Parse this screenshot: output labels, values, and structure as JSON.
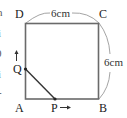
{
  "figure": {
    "vertices": {
      "D": "D",
      "C": "C",
      "A": "A",
      "B": "B"
    },
    "moving_points": {
      "Q": "Q",
      "P": "P"
    },
    "dimensions": {
      "top": "6cm",
      "right": "6cm"
    },
    "arrows": {
      "Q_direction": "up",
      "P_direction": "right"
    },
    "edge_fragments": [
      "n",
      "i",
      "0",
      "i",
      "-"
    ]
  },
  "colors": {
    "square_stroke": "#666666",
    "segment_stroke": "#333333",
    "arc_stroke": "#999999",
    "text": "#222222"
  }
}
